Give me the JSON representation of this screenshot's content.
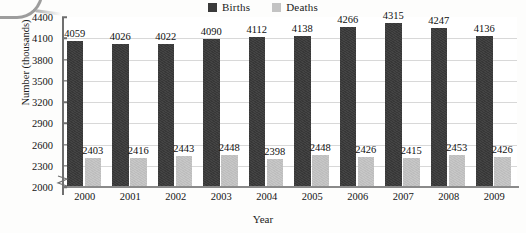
{
  "chart_data": {
    "type": "bar",
    "title": "",
    "xlabel": "Year",
    "ylabel": "Number (thousands)",
    "categories": [
      "2000",
      "2001",
      "2002",
      "2003",
      "2004",
      "2005",
      "2006",
      "2007",
      "2008",
      "2009"
    ],
    "series": [
      {
        "name": "Births",
        "color": "#3a3a3a",
        "values": [
          4059,
          4026,
          4022,
          4090,
          4112,
          4138,
          4266,
          4315,
          4247,
          4136
        ]
      },
      {
        "name": "Deaths",
        "color": "#c3c3c3",
        "values": [
          2403,
          2416,
          2443,
          2448,
          2398,
          2448,
          2426,
          2415,
          2453,
          2426
        ]
      }
    ],
    "ylim": [
      2000,
      4400
    ],
    "yticks": [
      2000,
      2300,
      2600,
      2900,
      3200,
      3500,
      3800,
      4100,
      4400
    ],
    "ytick_labels": [
      "2000",
      "2300",
      "2600",
      "2900",
      "3200",
      "3500",
      "3800",
      "4100",
      "4400"
    ],
    "y_axis_break": true,
    "grid": true,
    "grid_axis": "y",
    "legend_position": "top-center",
    "data_labels": true
  },
  "legend": {
    "entries": [
      {
        "label": "Births",
        "color": "#3a3a3a"
      },
      {
        "label": "Deaths",
        "color": "#c3c3c3"
      }
    ]
  },
  "axes": {
    "y_title": "Number (thousands)",
    "x_title": "Year"
  }
}
